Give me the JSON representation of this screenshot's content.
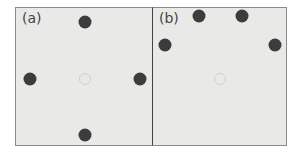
{
  "panels": [
    {
      "label": "(a)",
      "dots": [
        {
          "x": 69,
          "y": 14
        },
        {
          "x": 14,
          "y": 71
        },
        {
          "x": 124,
          "y": 71
        },
        {
          "x": 69,
          "y": 127
        }
      ],
      "center": {
        "x": 69,
        "y": 71
      }
    },
    {
      "label": "(b)",
      "dots": [
        {
          "x": 46,
          "y": 8
        },
        {
          "x": 89,
          "y": 8
        },
        {
          "x": 12,
          "y": 37
        },
        {
          "x": 122,
          "y": 37
        }
      ],
      "center": {
        "x": 67,
        "y": 71
      }
    }
  ],
  "colors": {
    "dot": "#3c3c3c",
    "background": "#e9e9e7",
    "ring": "#cfcfcf"
  }
}
